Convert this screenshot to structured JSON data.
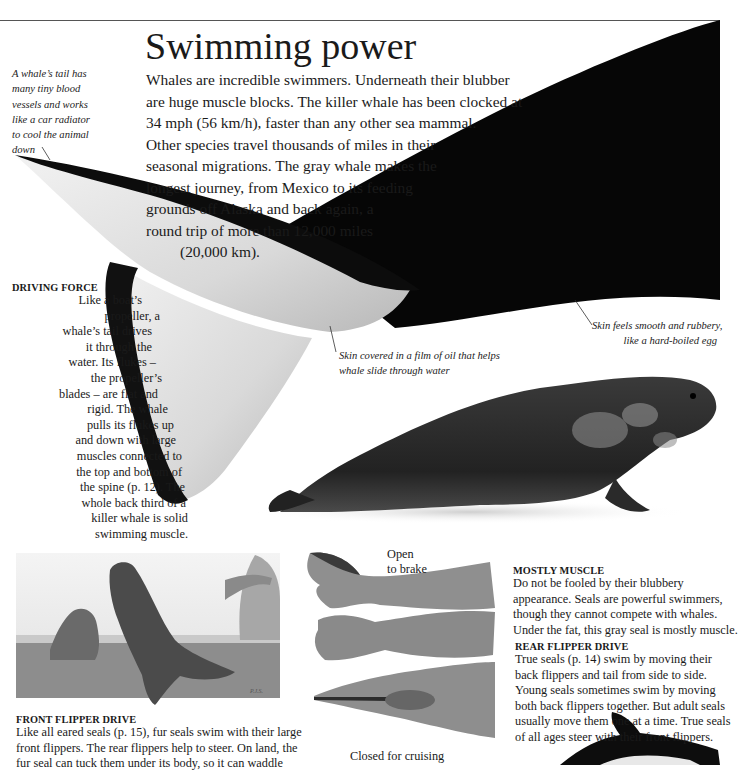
{
  "page": {
    "title": "Swimming power",
    "intro_lines": [
      "Whales are incredible swimmers. Underneath their blubber",
      "are huge muscle blocks. The killer whale has been clocked at",
      "34 mph (56 km/h), faster than any other sea mammal.",
      "Other species travel thousands of miles in their",
      "seasonal migrations. The gray whale makes the",
      "longest journey, from Mexico to its feeding",
      "grounds off Alaska and back again, a",
      "round trip of more than 12,000 miles",
      "(20,000 km)."
    ]
  },
  "annotations": {
    "tail_radiator": [
      "A whale’s tail has",
      "many tiny blood",
      "vessels and works",
      "like a car radiator",
      "to cool the animal",
      "down"
    ],
    "skin_smooth": [
      "Skin feels smooth and rubbery,",
      "like a hard-boiled egg"
    ],
    "skin_oil": [
      "Skin covered in a film of oil that helps",
      "whale slide through water"
    ],
    "flipper_open": [
      "Open",
      "to brake"
    ],
    "flipper_closed": "Closed for cruising"
  },
  "sections": {
    "driving_force": {
      "heading": "DRIVING FORCE",
      "lines": [
        "Like a boat’s",
        "propeller, a",
        "whale’s tail drives",
        "it through the",
        "water. Its flukes –",
        "the propeller’s",
        "blades – are flat and",
        "rigid. The whale",
        "pulls its flukes up",
        "and down with large",
        "muscles connected to",
        "the top and bottom of",
        "the spine (p. 12). The",
        "whole back third of a",
        "killer whale is solid",
        "swimming muscle."
      ]
    },
    "mostly_muscle": {
      "heading": "MOSTLY MUSCLE",
      "lines": [
        "Do not be fooled by their blubbery",
        "appearance. Seals are powerful swimmers,",
        "though they cannot compete with whales.",
        "Under the fat, this gray seal is mostly muscle."
      ]
    },
    "rear_flipper_drive": {
      "heading": "REAR FLIPPER DRIVE",
      "lines": [
        "True seals (p. 14) swim by moving their",
        "back flippers and tail from side to side.",
        "Young seals sometimes swim by moving",
        "both back flippers together. But adult seals",
        "usually move them one at a time. True seals",
        "of all ages steer with their front flippers."
      ]
    },
    "front_flipper_drive": {
      "heading": "FRONT FLIPPER DRIVE",
      "lines": [
        "Like all eared seals (p. 15), fur seals swim with their large",
        "front flippers. The rear flippers help to steer. On land, the",
        "fur seal can tuck them under its body, so it can waddle"
      ]
    }
  },
  "images": {
    "whale_tail": "killer-whale-tail-photo",
    "gray_seal": "gray-seal-photo",
    "fur_seals": "fur-seals-painting",
    "seal_flippers": "rear-flipper-drawings",
    "dolphin": "dolphin-partial-photo"
  },
  "colors": {
    "ink": "#1a1a1a",
    "whale_black": "#060606",
    "whale_white": "#e6e6e6",
    "seal_dark": "#2c2c2c",
    "rule": "#555555"
  }
}
